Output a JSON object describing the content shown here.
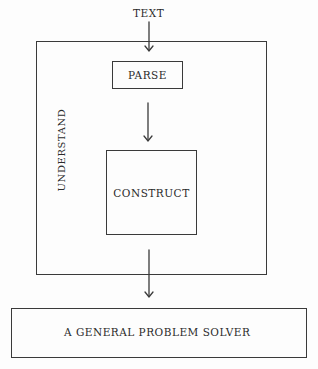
{
  "diagram": {
    "type": "block-flow",
    "input_label": "TEXT",
    "outer_box": {
      "label": "UNDERSTAND",
      "label_orientation": "vertical"
    },
    "inner_boxes": [
      {
        "id": "parse",
        "label": "PARSE"
      },
      {
        "id": "construct",
        "label": "CONSTRUCT"
      }
    ],
    "output_box": {
      "label": "A GENERAL PROBLEM SOLVER"
    },
    "edges": [
      {
        "from": "TEXT",
        "to": "PARSE"
      },
      {
        "from": "PARSE",
        "to": "CONSTRUCT"
      },
      {
        "from": "CONSTRUCT",
        "to": "A GENERAL PROBLEM SOLVER"
      }
    ],
    "colors": {
      "line": "#3a3a3a",
      "background": "#fdfdfd"
    }
  }
}
